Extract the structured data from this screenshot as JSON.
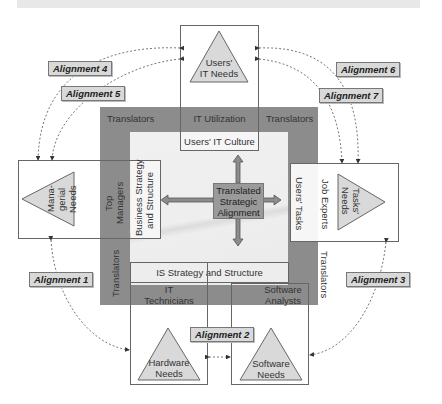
{
  "diagram": {
    "title_bar": "",
    "top_node": {
      "label_line1": "Users'",
      "label_line2": "IT Needs"
    },
    "left_node": {
      "label_line1": "Mana-",
      "label_line2": "gerial",
      "label_line3": "Needs"
    },
    "right_node": {
      "label_line1": "Tasks'",
      "label_line2": "Needs"
    },
    "bottom_left_node": {
      "label_line1": "Hardware",
      "label_line2": "Needs"
    },
    "bottom_right_node": {
      "label_line1": "Software",
      "label_line2": "Needs"
    },
    "frame": {
      "translators_top_left": "Translators",
      "translators_top_right": "Translators",
      "translators_left": "Translators",
      "translators_right": "Translators",
      "it_utilization": "IT Utilization",
      "users_it_culture": "Users' IT Culture",
      "top_managers_line1": "Top",
      "top_managers_line2": "Managers",
      "business_strategy_line1": "Business Strategy",
      "business_strategy_line2": "and Structure",
      "job_experts": "Job Experts",
      "users_tasks": "Users' Tasks",
      "is_strategy": "IS Strategy and Structure",
      "it_technicians_line1": "IT",
      "it_technicians_line2": "Technicians",
      "software_analysts_line1": "Software",
      "software_analysts_line2": "Analysts"
    },
    "center": {
      "line1": "Translated",
      "line2": "Strategic",
      "line3": "Alignment"
    },
    "alignments": [
      {
        "id": 1,
        "label": "Alignment 1"
      },
      {
        "id": 2,
        "label": "Alignment 2"
      },
      {
        "id": 3,
        "label": "Alignment 3"
      },
      {
        "id": 4,
        "label": "Alignment 4"
      },
      {
        "id": 5,
        "label": "Alignment 5"
      },
      {
        "id": 6,
        "label": "Alignment 6"
      },
      {
        "id": 7,
        "label": "Alignment 7"
      }
    ],
    "colors": {
      "frame_dark": "#8c8c8c",
      "inner_light": "#eeeeee",
      "triangle_fill": "#d9d9d9",
      "label_fill": "#d9d9d9",
      "center_fill": "#9a9a9a"
    }
  }
}
